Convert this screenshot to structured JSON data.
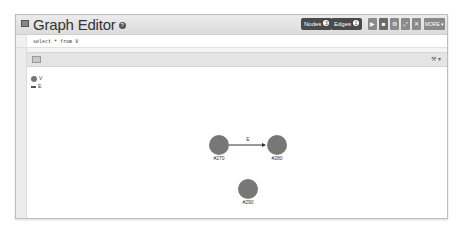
{
  "header": {
    "title": "Graph Editor",
    "help_glyph": "?",
    "nodes_button": {
      "label": "Nodes",
      "count": "3"
    },
    "edges_button": {
      "label": "Edges",
      "count": "1"
    },
    "tools": [
      {
        "name": "play-icon",
        "glyph": "▶"
      },
      {
        "name": "save-icon",
        "glyph": "■"
      },
      {
        "name": "gear-icon",
        "glyph": "⚙"
      },
      {
        "name": "fullscreen-icon",
        "glyph": "⤢"
      },
      {
        "name": "trash-icon",
        "glyph": "✕"
      }
    ],
    "more_label": "MORE ▾"
  },
  "query": {
    "value": "select * from V"
  },
  "toolbar": {
    "settings_glyph": "⚒ ▾"
  },
  "legend": {
    "vertex_class": "V",
    "edge_class": "E"
  },
  "graph": {
    "node_color": "#777777",
    "edge_color": "#333333",
    "nodes": [
      {
        "id": "#27:0",
        "label": "#270",
        "x": 192,
        "y": 78
      },
      {
        "id": "#28:0",
        "label": "#280",
        "x": 250,
        "y": 78
      },
      {
        "id": "#29:0",
        "label": "#290",
        "x": 221,
        "y": 122
      }
    ],
    "edges": [
      {
        "from": 0,
        "to": 1,
        "label": "E"
      }
    ]
  }
}
